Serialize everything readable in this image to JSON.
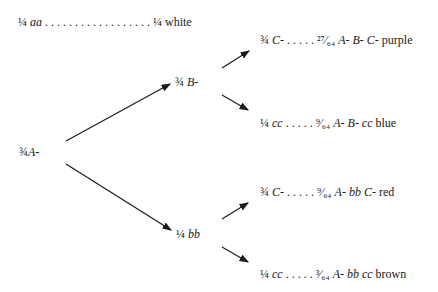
{
  "diagram": {
    "type": "branching-probability-tree",
    "top_line": {
      "frac": "¼",
      "genotype": "aa",
      "dots": " . . . . . . . . . . . . . . . . . . ",
      "result_frac": "¼",
      "phenotype": "white"
    },
    "root": {
      "frac": "¾",
      "genotype": "A-"
    },
    "level2": [
      {
        "frac": "¾",
        "genotype": "B-"
      },
      {
        "frac": "¼",
        "genotype": "bb"
      }
    ],
    "outcomes": [
      {
        "frac": "¾",
        "genotype": "C-",
        "dots": " . . . . . ",
        "result_frac": "²⁷⁄₆₄",
        "result_genotype": "A- B- C-",
        "phenotype": "purple"
      },
      {
        "frac": "¼",
        "genotype": "cc",
        "dots": " . . . . . ",
        "result_frac": "⁹⁄₆₄",
        "result_genotype": "A- B- cc",
        "phenotype": "blue"
      },
      {
        "frac": "¾",
        "genotype": "C-",
        "dots": " . . . . . ",
        "result_frac": "⁹⁄₆₄",
        "result_genotype": "A- bb C-",
        "phenotype": "red"
      },
      {
        "frac": "¼",
        "genotype": "cc",
        "dots": " . . . . . ",
        "result_frac": "³⁄₆₄",
        "result_genotype": "A- bb cc",
        "phenotype": "brown"
      }
    ]
  }
}
